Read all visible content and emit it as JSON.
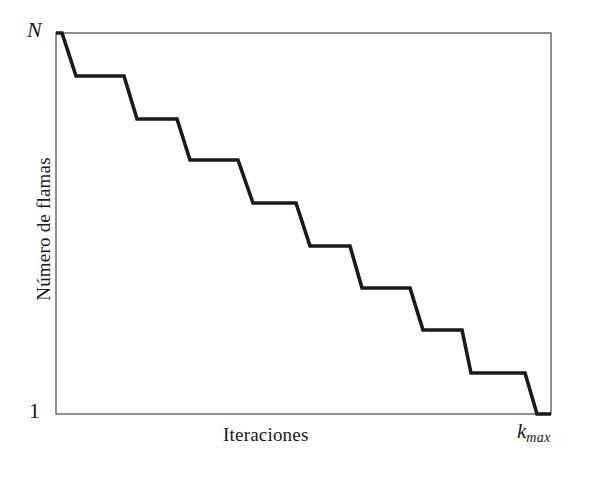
{
  "figure": {
    "background_color": "#ffffff",
    "line_color": "#1a1a1a",
    "axis_color": "#555555"
  },
  "labels": {
    "ylabel": "Número de flamas",
    "xlabel": "Iteraciones",
    "ytick_top": "N",
    "ytick_bottom": "1",
    "xtick_right_base": "k",
    "xtick_right_sub": "max"
  },
  "chart_data": {
    "type": "line",
    "title": "",
    "xlabel": "Iteraciones",
    "ylabel": "Número de flamas",
    "xlim": [
      0,
      1
    ],
    "ylim": [
      1,
      10
    ],
    "xtick_labels": [
      "",
      "k_max"
    ],
    "ytick_labels": [
      "1",
      "N"
    ],
    "grid": false,
    "legend": null,
    "annotations": [],
    "step_count": 10,
    "x": [
      0.0,
      0.012,
      0.04,
      0.137,
      0.164,
      0.245,
      0.283,
      0.371,
      0.402,
      0.485,
      0.515,
      0.602,
      0.632,
      0.719,
      0.751,
      0.821,
      0.841,
      0.926,
      0.95,
      1.0
    ],
    "y": [
      10.0,
      10.0,
      9.0,
      9.0,
      8.0,
      8.0,
      7.0,
      7.0,
      6.0,
      6.0,
      5.0,
      5.0,
      4.0,
      4.0,
      3.0,
      3.0,
      2.0,
      2.0,
      1.0,
      1.0
    ],
    "pixel_polyline": [
      [
        56,
        33
      ],
      [
        62,
        33
      ],
      [
        76,
        76
      ],
      [
        124,
        76
      ],
      [
        137,
        119
      ],
      [
        177,
        119
      ],
      [
        190,
        160
      ],
      [
        238,
        160
      ],
      [
        253,
        203
      ],
      [
        296,
        203
      ],
      [
        310,
        246
      ],
      [
        350,
        246
      ],
      [
        362,
        288
      ],
      [
        410,
        288
      ],
      [
        423,
        330
      ],
      [
        462,
        330
      ],
      [
        471,
        373
      ],
      [
        525,
        373
      ],
      [
        537,
        414
      ],
      [
        551,
        414
      ]
    ],
    "plot_box_pixels": {
      "left": 56,
      "top": 33,
      "right": 551,
      "bottom": 414
    }
  }
}
